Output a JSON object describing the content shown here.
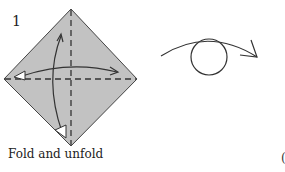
{
  "step": {
    "number": "1",
    "caption": "Fold and unfold"
  },
  "next_step_fragment": "(",
  "colors": {
    "paper_fill": "#c2c2c2",
    "line": "#333333",
    "background": "#ffffff"
  },
  "symbols": {
    "fold_lines": [
      "vertical-valley-fold-dashed",
      "horizontal-valley-fold-dashed"
    ],
    "arrows": [
      "fold-and-unfold-horizontal-arrow",
      "fold-and-unfold-vertical-arrow"
    ],
    "turn_over": "turn-over-symbol"
  }
}
